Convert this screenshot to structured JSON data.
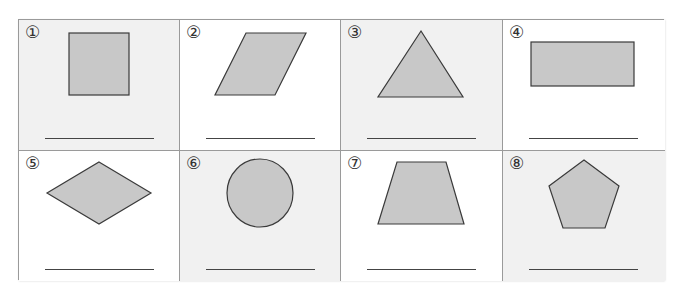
{
  "worksheet": {
    "colors": {
      "shape_fill": "#c8c8c8",
      "shape_stroke": "#3a3a3a",
      "cell_gray": "#f1f1f1",
      "cell_white": "#ffffff",
      "border": "#9a9a9a"
    },
    "cells": [
      {
        "number": "①",
        "shape": "square",
        "answer": ""
      },
      {
        "number": "②",
        "shape": "parallelogram",
        "answer": ""
      },
      {
        "number": "③",
        "shape": "triangle",
        "answer": ""
      },
      {
        "number": "④",
        "shape": "rectangle",
        "answer": ""
      },
      {
        "number": "⑤",
        "shape": "rhombus",
        "answer": ""
      },
      {
        "number": "⑥",
        "shape": "circle",
        "answer": ""
      },
      {
        "number": "⑦",
        "shape": "trapezoid",
        "answer": ""
      },
      {
        "number": "⑧",
        "shape": "pentagon",
        "answer": ""
      }
    ]
  }
}
